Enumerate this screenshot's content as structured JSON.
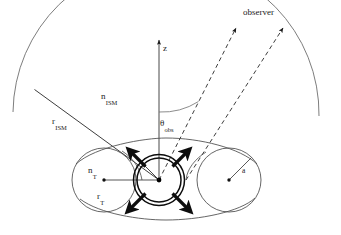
{
  "figure": {
    "background_color": "#ffffff",
    "line_color": "#1a1a1a",
    "thin_line_color": "#555555",
    "width": 341,
    "height": 235
  },
  "labels": {
    "observer": "observer",
    "z_axis": "z",
    "n_ism_base": "n",
    "n_ism_sub": "ISM",
    "r_ism_base": "r",
    "r_ism_sub": "ISM",
    "theta_obs_base": "θ",
    "theta_obs_sub": "obs",
    "n_torus_base": "n",
    "n_torus_sub": "T",
    "r_torus_base": "r",
    "r_torus_sub": "T",
    "torus_radius": "a"
  },
  "geometry": {
    "origin_x": 159,
    "origin_y": 180,
    "ism_arc_radius": 150,
    "inner_circle_radius": 22,
    "outer_circle_radius": 25,
    "torus_left_center_x": 104,
    "torus_left_center_y": 180,
    "torus_left_radius": 32,
    "torus_right_center_x": 229,
    "torus_right_center_y": 180,
    "torus_right_radius": 32,
    "theta_obs_degrees": 35,
    "z_axis_top_y": 36
  },
  "elements": {
    "ism_arc_name": "ism-boundary-arc",
    "ism_radius_line_name": "r-ism-radius-line",
    "z_axis_name": "z-axis-arrow",
    "theta_arc_name": "theta-obs-angle-arc",
    "los_inner_name": "line-of-sight-inner-dashed",
    "los_outer_name": "line-of-sight-outer-dashed",
    "torus_outline_name": "torus-cross-section-outline",
    "central_source_name": "central-source-double-circle",
    "outflow_arrows_name": "outflow-arrows",
    "r_torus_line_name": "r-torus-radius-line",
    "a_radius_line_name": "torus-minor-radius-line"
  }
}
